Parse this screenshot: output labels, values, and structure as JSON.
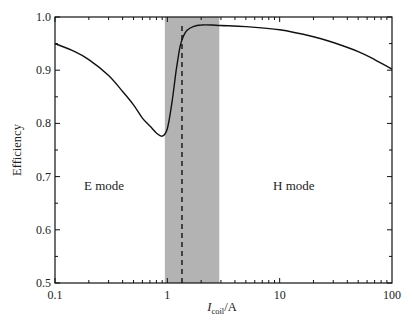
{
  "chart_data": {
    "type": "line",
    "title": "",
    "xlabel": "I_coil/A",
    "xlabel_main": "I",
    "xlabel_sub": "coil",
    "xlabel_unit": "/A",
    "ylabel": "Efficiency",
    "xscale": "log",
    "xlim": [
      0.1,
      100
    ],
    "ylim": [
      0.5,
      1.0
    ],
    "xticks": [
      0.1,
      1,
      10,
      100
    ],
    "xtick_labels": [
      "0.1",
      "1",
      "10",
      "100"
    ],
    "yticks": [
      0.5,
      0.6,
      0.7,
      0.8,
      0.9,
      1.0
    ],
    "ytick_labels": [
      "0.5",
      "0.6",
      "0.7",
      "0.8",
      "0.9",
      "1.0"
    ],
    "grid": false,
    "series": [
      {
        "name": "Efficiency",
        "x": [
          0.1,
          0.15,
          0.2,
          0.3,
          0.4,
          0.5,
          0.6,
          0.7,
          0.8,
          0.9,
          1.0,
          1.1,
          1.2,
          1.3,
          1.4,
          1.5,
          1.7,
          2.0,
          2.5,
          3.0,
          5.0,
          10,
          20,
          30,
          50,
          70,
          100
        ],
        "y": [
          0.95,
          0.935,
          0.92,
          0.89,
          0.86,
          0.835,
          0.81,
          0.795,
          0.782,
          0.776,
          0.79,
          0.84,
          0.9,
          0.945,
          0.965,
          0.975,
          0.982,
          0.985,
          0.985,
          0.984,
          0.982,
          0.976,
          0.963,
          0.952,
          0.935,
          0.92,
          0.902
        ]
      }
    ],
    "shaded_region": {
      "x": [
        0.95,
        2.9
      ],
      "color": "#b3b3b3"
    },
    "dashed_line": {
      "x": 1.35,
      "y_from": 0.5,
      "y_to": 0.985
    },
    "annotations": [
      {
        "text": "E mode",
        "x": 0.2,
        "y": 0.7
      },
      {
        "text": "H mode",
        "x": 12,
        "y": 0.7
      }
    ]
  },
  "labels": {
    "e_mode": "E mode",
    "h_mode": "H mode"
  }
}
